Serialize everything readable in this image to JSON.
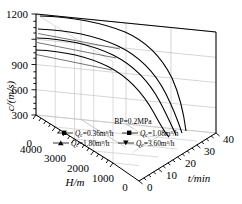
{
  "chart_data": {
    "type": "line",
    "title": "",
    "projection": "3d",
    "annotation": "BP=0.2MPa",
    "xlabel": "t/min",
    "ylabel": "H/m",
    "zlabel": "c/(m/s)",
    "xlim": [
      0,
      40
    ],
    "ylim": [
      0,
      4000
    ],
    "zlim": [
      0,
      1200
    ],
    "xticks": [
      "0",
      "10",
      "20",
      "30",
      "40"
    ],
    "yticks": [
      "0",
      "1000",
      "2000",
      "3000",
      "4000"
    ],
    "zticks": [
      "0",
      "300",
      "600",
      "900",
      "1200"
    ],
    "grid": true,
    "legend_position": "bottom-center",
    "x": [
      0,
      2,
      4,
      6,
      8,
      10,
      12,
      14,
      16,
      18,
      20,
      22,
      24,
      26,
      28,
      30,
      32,
      34,
      36,
      38,
      40
    ],
    "series": [
      {
        "name": "Q_c=0.36m³/h",
        "marker": "square",
        "values": [
          1200,
          1198,
          1194,
          1188,
          1180,
          1170,
          1156,
          1138,
          1116,
          1088,
          1054,
          1012,
          960,
          898,
          824,
          736,
          632,
          510,
          370,
          205,
          20
        ]
      },
      {
        "name": "Q_c=1.08m³/h",
        "marker": "square",
        "values": [
          1080,
          1078,
          1074,
          1068,
          1060,
          1050,
          1036,
          1018,
          996,
          968,
          934,
          892,
          842,
          782,
          710,
          626,
          528,
          414,
          286,
          146,
          15
        ]
      },
      {
        "name": "Q_c=1.80m³/h",
        "marker": "triangle-up",
        "values": [
          980,
          978,
          974,
          968,
          960,
          950,
          936,
          918,
          896,
          868,
          834,
          794,
          746,
          688,
          620,
          540,
          450,
          346,
          232,
          112,
          10
        ]
      },
      {
        "name": "Q_c=3.60m³/h",
        "marker": "triangle-down",
        "values": [
          840,
          838,
          834,
          829,
          822,
          812,
          799,
          783,
          762,
          736,
          705,
          668,
          624,
          572,
          512,
          442,
          364,
          276,
          180,
          82,
          8
        ]
      }
    ]
  },
  "axes": {
    "z_label": "c/(m/s)",
    "z_ticks": [
      "1200",
      "900",
      "600",
      "300",
      "0"
    ],
    "y_label": "H/m",
    "y_ticks": [
      "4000",
      "3000",
      "2000",
      "1000",
      "0"
    ],
    "x_label": "t/min",
    "x_ticks": [
      "0",
      "10",
      "20",
      "30",
      "40"
    ]
  },
  "annotation": {
    "text": "BP=0.2MPa"
  },
  "legend": {
    "items": [
      {
        "marker": "square",
        "var": "Q",
        "sub": "c",
        "value": "=0.36m³/h"
      },
      {
        "marker": "square",
        "var": "Q",
        "sub": "c",
        "value": "=1.08m³/h"
      },
      {
        "marker": "triangle-up",
        "var": "Q",
        "sub": "c",
        "value": "=1.80m³/h"
      },
      {
        "marker": "triangle-down",
        "var": "Q",
        "sub": "c",
        "value": "=3.60m³/h"
      }
    ]
  },
  "colors": {
    "ink": "#000000",
    "grid": "#b9b9b9",
    "background": "#ffffff"
  }
}
